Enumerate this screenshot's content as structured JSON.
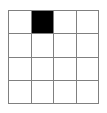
{
  "figure": {
    "name": "grid-with-one-filled-cell",
    "background_color": "#ffffff",
    "grid_line_color": "#808080",
    "grid_line_width_px": 1.5,
    "filled_cell_color": "#000000",
    "empty_cell_color": "#ffffff",
    "rows": 4,
    "columns": 4,
    "grid_left_px": 8,
    "grid_top_px": 10,
    "grid_width_px": 91,
    "grid_height_px": 94
  },
  "chart_data": {
    "type": "heatmap",
    "title": "",
    "subtitle": "",
    "xlabel": "",
    "ylabel": "",
    "grid": true,
    "legend": "none",
    "rows": 4,
    "columns": 4,
    "categories": [
      "1",
      "2",
      "3",
      "4"
    ],
    "row_labels": [
      "1",
      "2",
      "3",
      "4"
    ],
    "column_labels": [
      "1",
      "2",
      "3",
      "4"
    ],
    "colorscale": {
      "0": "#ffffff",
      "1": "#000000"
    },
    "values": [
      [
        0,
        1,
        0,
        0
      ],
      [
        0,
        0,
        0,
        0
      ],
      [
        0,
        0,
        0,
        0
      ],
      [
        0,
        0,
        0,
        0
      ]
    ],
    "filled_cells": [
      {
        "row": 1,
        "column": 2
      }
    ],
    "annotations": []
  }
}
